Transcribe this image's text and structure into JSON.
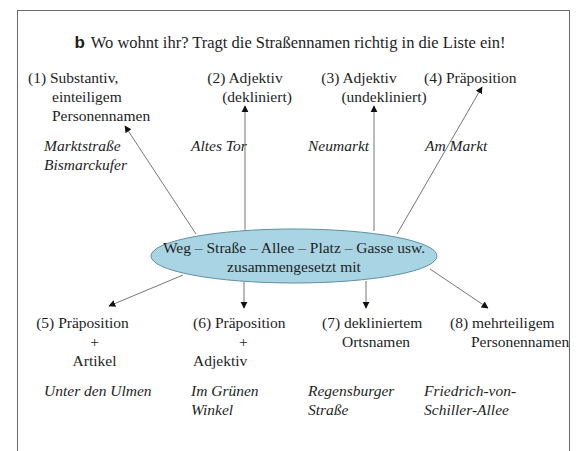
{
  "task": {
    "letter": "b",
    "instruction": "Wo wohnt ihr? Tragt die Straßennamen richtig in die Liste ein!"
  },
  "center": {
    "line1": "Weg – Straße – Allee – Platz – Gasse usw.",
    "line2": "zusammengesetzt mit",
    "fill_color": "#a9d4e4"
  },
  "categories": [
    {
      "number": "(1)",
      "lines": [
        "Substantiv,",
        "einteiligem",
        "Personennamen"
      ],
      "examples": [
        "Marktstraße",
        "Bismarckufer"
      ]
    },
    {
      "number": "(2)",
      "lines": [
        "Adjektiv",
        "(dekliniert)"
      ],
      "examples": [
        "Altes Tor"
      ]
    },
    {
      "number": "(3)",
      "lines": [
        "Adjektiv",
        "(undekliniert)"
      ],
      "examples": [
        "Neumarkt"
      ]
    },
    {
      "number": "(4)",
      "lines": [
        "Präposition"
      ],
      "examples": [
        "Am Markt"
      ]
    },
    {
      "number": "(5)",
      "lines": [
        "Präposition",
        "+",
        "Artikel"
      ],
      "examples": [
        "Unter den Ulmen"
      ]
    },
    {
      "number": "(6)",
      "lines": [
        "Präposition",
        "+",
        "Adjektiv"
      ],
      "examples": [
        "Im Grünen",
        "Winkel"
      ]
    },
    {
      "number": "(7)",
      "lines": [
        "dekliniertem",
        "Ortsnamen"
      ],
      "examples": [
        "Regensburger",
        "Straße"
      ]
    },
    {
      "number": "(8)",
      "lines": [
        "mehrteiligem",
        "Personennamen"
      ],
      "examples": [
        "Friedrich-von-",
        "Schiller-Allee"
      ]
    }
  ]
}
